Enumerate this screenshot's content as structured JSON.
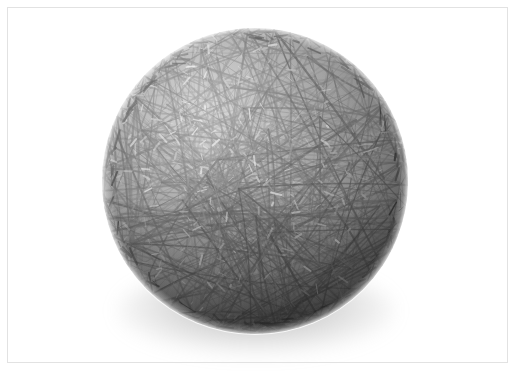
{
  "page": {
    "width": 517,
    "height": 372,
    "background_color": "#ffffff",
    "media_type": "photograph"
  },
  "frame": {
    "name": "inset-border",
    "inset_px": 7,
    "line_color": "#e2e2e2",
    "line_width": 1
  },
  "artwork": {
    "title": "String Ball",
    "subject": "sphere of tangled thread",
    "palette": {
      "background": "#ffffff",
      "thread_dark": "#4a4a4a",
      "thread_mid": "#6e6e6e",
      "thread_light": "#9a9a9a",
      "gap_highlight": "#f2f2f2",
      "shadow": "#8a8a8a",
      "rim_shadow": "#555555"
    },
    "sphere": {
      "center_x": 255,
      "center_y": 181,
      "radius": 153,
      "fill_base": "#8c8c8c"
    },
    "lighting": {
      "key_light_direction": "upper-left",
      "highlight_x": 190,
      "highlight_y": 110,
      "terminator": "lower-right",
      "ambient_occlusion": "bottom"
    },
    "thread_geometry": {
      "description": "straight chords across the disc crossing at shared nodes",
      "chord_count": 520,
      "node_count": 46,
      "stroke_min": 0.5,
      "stroke_max": 2.1,
      "opacity_min": 0.22,
      "opacity_max": 0.72,
      "random_seed": 20240517
    },
    "contact_shadow": {
      "center_x": 256,
      "center_y": 311,
      "radius_x": 138,
      "radius_y": 43,
      "blur_px": 9,
      "color": "#787878"
    }
  }
}
